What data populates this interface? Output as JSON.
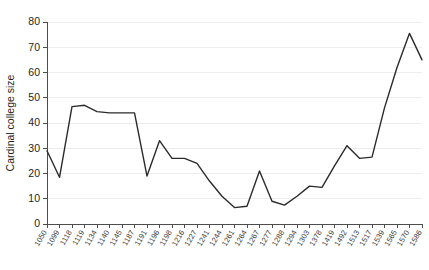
{
  "chart_data": {
    "type": "line",
    "title": "",
    "xlabel": "",
    "ylabel": "Cardinal college size",
    "ylim": [
      0,
      80
    ],
    "yticks": [
      0,
      10,
      20,
      30,
      40,
      50,
      60,
      70,
      80
    ],
    "grid": true,
    "grid_axis": "y",
    "legend": null,
    "line_color": "#2b2b2b",
    "categories": [
      "1050",
      "1099",
      "1118",
      "1119",
      "1134",
      "1140",
      "1145",
      "1187",
      "1191",
      "1196",
      "1198",
      "1216",
      "1227",
      "1241",
      "1244",
      "1261",
      "1264",
      "1267",
      "1277",
      "1288",
      "1294",
      "1303",
      "1378",
      "1419",
      "1492",
      "1513",
      "1517",
      "1539",
      "1565",
      "1570",
      "1586"
    ],
    "values": [
      29,
      18.5,
      46.5,
      47,
      44.5,
      44,
      44,
      44,
      19,
      33,
      26,
      26,
      24,
      17,
      11,
      6.5,
      7,
      21,
      9,
      7.5,
      11,
      15,
      14.5,
      23,
      31,
      26,
      26.5,
      46,
      62,
      75.5,
      65
    ],
    "series": [
      {
        "name": "Cardinal college size",
        "values": [
          29,
          18.5,
          46.5,
          47,
          44.5,
          44,
          44,
          44,
          19,
          33,
          26,
          26,
          24,
          17,
          11,
          6.5,
          7,
          21,
          9,
          7.5,
          11,
          15,
          14.5,
          23,
          31,
          26,
          26.5,
          46,
          62,
          75.5,
          65
        ]
      }
    ]
  }
}
